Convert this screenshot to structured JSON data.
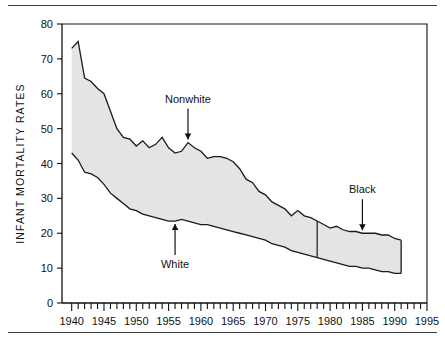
{
  "figure": {
    "has_top_rule": true,
    "has_bottom_rule": true,
    "rule_color": "#3a3a3a",
    "background": "#ffffff"
  },
  "chart_data": {
    "type": "area",
    "title": "",
    "subtitle": "",
    "xlabel": "",
    "ylabel": "INFANT MORTALITY RATES",
    "xlim": [
      1938.5,
      1995
    ],
    "ylim": [
      0,
      80
    ],
    "yticks": [
      0,
      10,
      20,
      30,
      40,
      50,
      60,
      70,
      80
    ],
    "ytick_labels": [
      "0",
      "10",
      "20",
      "30",
      "40",
      "50",
      "60",
      "70",
      "80"
    ],
    "xticks": [
      1940,
      1945,
      1950,
      1955,
      1960,
      1965,
      1970,
      1975,
      1980,
      1985,
      1990,
      1995
    ],
    "xtick_labels": [
      "1940",
      "1945",
      "1950",
      "1955",
      "1960",
      "1965",
      "1970",
      "1975",
      "1980",
      "1985",
      "1990",
      "1995"
    ],
    "x_minor_tick_interval": 1,
    "grid": false,
    "legend_position": "annotations-inline",
    "fill_color": "#e4e4e4",
    "edge_color": "#1a1a1a",
    "x": [
      1940,
      1941,
      1942,
      1943,
      1944,
      1945,
      1946,
      1947,
      1948,
      1949,
      1950,
      1951,
      1952,
      1953,
      1954,
      1955,
      1956,
      1957,
      1958,
      1959,
      1960,
      1961,
      1962,
      1963,
      1964,
      1965,
      1966,
      1967,
      1968,
      1969,
      1970,
      1971,
      1972,
      1973,
      1974,
      1975,
      1976,
      1977,
      1978,
      1979,
      1980,
      1981,
      1982,
      1983,
      1984,
      1985,
      1986,
      1987,
      1988,
      1989,
      1990,
      1991
    ],
    "series": [
      {
        "name": "Nonwhite",
        "label_in_chart": "Nonwhite",
        "role": "upper-boundary",
        "definition_change_year": 1978,
        "definition_after_change": "Black",
        "values": [
          73.0,
          75.0,
          64.5,
          63.5,
          61.5,
          60.0,
          55.0,
          50.0,
          47.5,
          47.0,
          45.0,
          46.5,
          44.5,
          45.5,
          47.5,
          44.5,
          43.0,
          43.5,
          46.0,
          44.5,
          43.5,
          41.5,
          42.0,
          42.0,
          41.5,
          40.5,
          38.5,
          35.5,
          34.5,
          32.0,
          31.0,
          29.0,
          28.0,
          27.0,
          25.0,
          26.5,
          25.0,
          24.5,
          23.5,
          22.5,
          21.5,
          22.0,
          21.0,
          20.5,
          20.5,
          20.0,
          20.0,
          20.0,
          19.5,
          19.5,
          18.5,
          18.0
        ]
      },
      {
        "name": "White",
        "label_in_chart": "White",
        "role": "lower-boundary",
        "values": [
          43.0,
          41.0,
          37.5,
          37.0,
          36.0,
          34.0,
          31.5,
          30.0,
          28.5,
          27.0,
          26.5,
          25.5,
          25.0,
          24.5,
          24.0,
          23.5,
          23.5,
          24.0,
          23.5,
          23.0,
          22.5,
          22.5,
          22.0,
          21.5,
          21.0,
          20.5,
          20.0,
          19.5,
          19.0,
          18.5,
          18.0,
          17.0,
          16.5,
          16.0,
          15.0,
          14.5,
          14.0,
          13.5,
          13.0,
          12.5,
          12.0,
          11.5,
          11.0,
          10.5,
          10.5,
          10.0,
          10.0,
          9.5,
          9.0,
          9.0,
          8.5,
          8.5
        ]
      }
    ],
    "annotations": [
      {
        "id": "nonwhite",
        "text": "Nonwhite",
        "points_to_series": "Nonwhite",
        "point_year": 1958,
        "point_value": 46.0,
        "arrow_direction": "down"
      },
      {
        "id": "white",
        "text": "White",
        "points_to_series": "White",
        "point_year": 1956,
        "point_value": 23.5,
        "arrow_direction": "up"
      },
      {
        "id": "black",
        "text": "Black",
        "points_to_series": "Nonwhite",
        "point_year": 1985,
        "point_value": 20.0,
        "arrow_direction": "down"
      }
    ],
    "markers": [
      {
        "id": "definition-change",
        "type": "vertical-line",
        "year": 1978,
        "note": "Nonwhite category replaced by Black"
      }
    ]
  }
}
